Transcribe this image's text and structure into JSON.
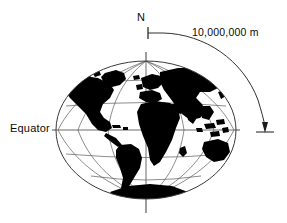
{
  "figure": {
    "labels": {
      "north_pole": "N",
      "arc_distance": "10,000,000 m",
      "equator": "Equator"
    },
    "colors": {
      "land": "#000000",
      "graticule": "#555555",
      "outline": "#333333",
      "annotation": "#1a1a1a",
      "background": "#ffffff"
    },
    "globe": {
      "projection": "elliptical",
      "center_x": 146,
      "center_y": 130,
      "semi_axis_x": 90,
      "semi_axis_y": 69,
      "parallels_deg": [
        -60,
        -30,
        0,
        30,
        60
      ],
      "meridians_deg": [
        -90,
        -60,
        -30,
        0,
        30,
        60,
        90
      ],
      "equator_line_y": 130,
      "polar_axis_x": 146
    },
    "annotation_arc": {
      "from_label": "N",
      "to_label": "Equator",
      "value": "10,000,000 m",
      "start_x": 148,
      "start_y": 33,
      "end_x": 265,
      "end_y": 130
    }
  }
}
